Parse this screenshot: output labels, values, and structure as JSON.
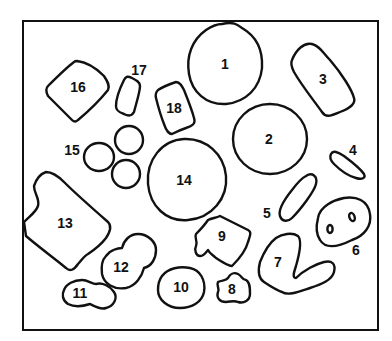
{
  "diagram": {
    "frame": {
      "x": 23,
      "y": 21,
      "width": 355,
      "height": 309
    },
    "colors": {
      "stroke": "#111111",
      "background": "#ffffff"
    },
    "shapes": [
      {
        "id": 1,
        "label": "1",
        "kind": "round blob",
        "label_pos": [
          225,
          64
        ]
      },
      {
        "id": 2,
        "label": "2",
        "kind": "circle",
        "label_pos": [
          269,
          139
        ]
      },
      {
        "id": 3,
        "label": "3",
        "kind": "rounded rectangle (tilted)",
        "label_pos": [
          323,
          79
        ]
      },
      {
        "id": 4,
        "label": "4",
        "kind": "thin ellipse",
        "label_pos": [
          353,
          150
        ]
      },
      {
        "id": 5,
        "label": "5",
        "kind": "capsule (tilted)",
        "label_pos": [
          267,
          213
        ]
      },
      {
        "id": 6,
        "label": "6",
        "kind": "blob with two holes",
        "label_pos": [
          356,
          250
        ]
      },
      {
        "id": 7,
        "label": "7",
        "kind": "V-shaped blob",
        "label_pos": [
          278,
          262
        ]
      },
      {
        "id": 8,
        "label": "8",
        "kind": "irregular small blob",
        "label_pos": [
          232,
          289
        ]
      },
      {
        "id": 9,
        "label": "9",
        "kind": "irregular jagged blob",
        "label_pos": [
          222,
          236
        ]
      },
      {
        "id": 10,
        "label": "10",
        "kind": "round blob",
        "label_pos": [
          181,
          287
        ]
      },
      {
        "id": 11,
        "label": "11",
        "kind": "double-lobed blob",
        "label_pos": [
          80,
          293
        ]
      },
      {
        "id": 12,
        "label": "12",
        "kind": "double-lobed blob",
        "label_pos": [
          121,
          267
        ]
      },
      {
        "id": 13,
        "label": "13",
        "kind": "irregular polygon",
        "label_pos": [
          65,
          223
        ]
      },
      {
        "id": 14,
        "label": "14",
        "kind": "large circle",
        "label_pos": [
          184,
          180
        ]
      },
      {
        "id": 15,
        "label": "15",
        "kind": "cluster of three circles",
        "label_pos": [
          72,
          150
        ]
      },
      {
        "id": 16,
        "label": "16",
        "kind": "diamond / kite",
        "label_pos": [
          78,
          87
        ]
      },
      {
        "id": 17,
        "label": "17",
        "kind": "rounded rectangle (small)",
        "label_pos": [
          139,
          70
        ]
      },
      {
        "id": 18,
        "label": "18",
        "kind": "rounded rectangle (tilted)",
        "label_pos": [
          174,
          108
        ]
      }
    ]
  }
}
